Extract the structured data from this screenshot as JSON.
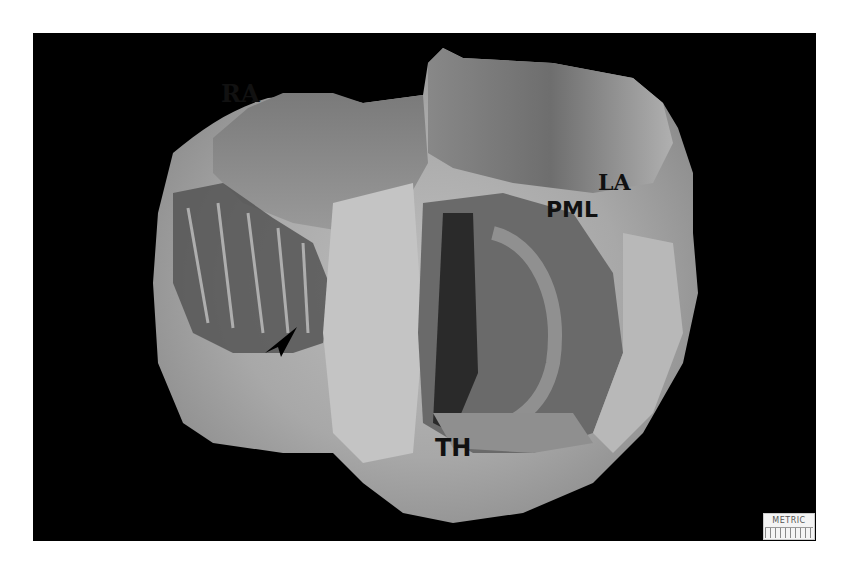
{
  "image": {
    "subject": "sectioned heart specimen photograph",
    "background_color": "#000000",
    "page_color": "#ffffff"
  },
  "labels": {
    "ra": "RA",
    "la": "LA",
    "pml": "PML",
    "th": "TH"
  },
  "annotations": {
    "arrow": "arrow-pointer"
  },
  "ruler": {
    "text": "METRIC"
  }
}
